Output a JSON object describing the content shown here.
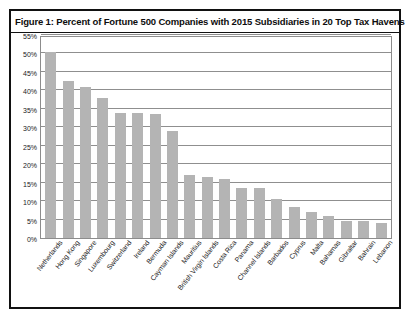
{
  "figure": {
    "title": "Figure 1: Percent of Fortune 500 Companies with 2015 Subsidiaries in 20 Top Tax Havens"
  },
  "colors": {
    "bar_fill": "#b4b4b4",
    "gridline": "#8f8f8f",
    "frame": "#111111",
    "text": "#1a1a1a",
    "background": "#ffffff"
  },
  "chart_data": {
    "type": "bar",
    "title": "Figure 1: Percent of Fortune 500 Companies with 2015 Subsidiaries in 20 Top Tax Havens",
    "xlabel": "",
    "ylabel": "",
    "ylim": [
      0,
      55
    ],
    "ytick_labels": [
      "0%",
      "5%",
      "10%",
      "15%",
      "20%",
      "25%",
      "30%",
      "35%",
      "40%",
      "45%",
      "50%",
      "55%"
    ],
    "ytick_values": [
      0,
      5,
      10,
      15,
      20,
      25,
      30,
      35,
      40,
      45,
      50,
      55
    ],
    "grid": true,
    "legend": false,
    "categories": [
      "Netherlands",
      "Hong Kong",
      "Singapore",
      "Luxembourg",
      "Switzerland",
      "Ireland",
      "Bermuda",
      "Cayman Islands",
      "Mauritius",
      "British Virgin Islands",
      "Costa Rica",
      "Panama",
      "Channel Islands",
      "Barbados",
      "Cyprus",
      "Malta",
      "Bahamas",
      "Gibraltar",
      "Bahrain",
      "Lebanon"
    ],
    "values": [
      50.5,
      42.5,
      41,
      38,
      34,
      34,
      33.5,
      29,
      17,
      16.5,
      16,
      13.5,
      13.5,
      10.5,
      8.5,
      7,
      6,
      4.5,
      4.5,
      4
    ]
  }
}
